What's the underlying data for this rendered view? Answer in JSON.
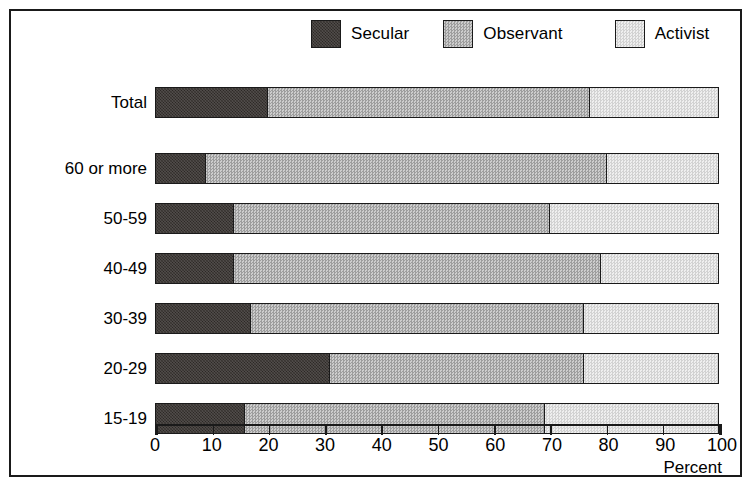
{
  "figure": {
    "frame_color": "#1a1a1a",
    "background": "#ffffff"
  },
  "legend": {
    "position": "top-center",
    "entries": [
      {
        "label": "Secular",
        "swatch": "dark-dither-swatch",
        "color": "#2b2724"
      },
      {
        "label": "Observant",
        "swatch": "medium-dither-swatch",
        "color": "#b9b9b9"
      },
      {
        "label": "Activist",
        "swatch": "light-dither-swatch",
        "color": "#e3e3e3"
      }
    ]
  },
  "axis": {
    "title": "Percent",
    "ticks": [
      "0",
      "10",
      "20",
      "30",
      "40",
      "50",
      "60",
      "70",
      "80",
      "90",
      "100"
    ]
  },
  "chart_data": {
    "type": "bar",
    "orientation": "horizontal",
    "stacked": true,
    "stack_mode": "percent",
    "title": "",
    "xlabel": "Percent",
    "ylabel": "",
    "xlim": [
      0,
      100
    ],
    "xticks": [
      0,
      10,
      20,
      30,
      40,
      50,
      60,
      70,
      80,
      90,
      100
    ],
    "grid": false,
    "legend": [
      "Secular",
      "Observant",
      "Activist"
    ],
    "legend_position": "top-center",
    "categories": [
      "Total",
      "60 or more",
      "50-59",
      "40-49",
      "30-39",
      "20-29",
      "15-19"
    ],
    "series": [
      {
        "name": "Secular",
        "values": [
          20,
          9,
          14,
          14,
          17,
          31,
          16
        ]
      },
      {
        "name": "Observant",
        "values": [
          57,
          71,
          56,
          65,
          59,
          45,
          53
        ]
      },
      {
        "name": "Activist",
        "values": [
          23,
          20,
          30,
          21,
          24,
          24,
          31
        ]
      }
    ],
    "cumulative_boundaries": [
      {
        "category": "Total",
        "secular_end": 20,
        "observant_end": 77
      },
      {
        "category": "60 or more",
        "secular_end": 9,
        "observant_end": 80
      },
      {
        "category": "50-59",
        "secular_end": 14,
        "observant_end": 70
      },
      {
        "category": "40-49",
        "secular_end": 14,
        "observant_end": 79
      },
      {
        "category": "30-39",
        "secular_end": 17,
        "observant_end": 76
      },
      {
        "category": "20-29",
        "secular_end": 31,
        "observant_end": 76
      },
      {
        "category": "15-19",
        "secular_end": 16,
        "observant_end": 69
      }
    ]
  }
}
